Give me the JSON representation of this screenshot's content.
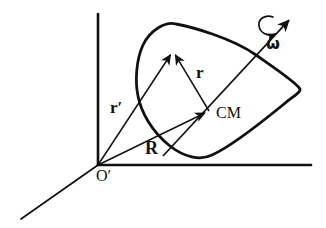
{
  "figure": {
    "type": "physics-vector-diagram",
    "width": 326,
    "height": 228,
    "background_color": "#ffffff",
    "ink_color": "#111111"
  },
  "labels": {
    "r_prime": "r′",
    "r": "r",
    "R": "R",
    "cm": "CM",
    "omega": "ω",
    "origin": "O′"
  },
  "axes": {
    "vertical": {
      "name": "vertical-axis",
      "from": [
        98,
        165
      ],
      "to": [
        98,
        14
      ],
      "stroke_width": 2.6
    },
    "horizontal": {
      "name": "horizontal-axis",
      "from": [
        98,
        165
      ],
      "to": [
        311,
        165
      ],
      "stroke_width": 2.6
    },
    "depth": {
      "name": "depth-axis",
      "from": [
        98,
        165
      ],
      "to": [
        21,
        219
      ],
      "stroke_width": 1.7
    }
  },
  "points": {
    "origin": [
      98,
      165
    ],
    "center_of_mass": [
      209,
      111
    ],
    "particle": [
      173,
      51
    ]
  },
  "vectors": [
    {
      "name": "r-prime-vector",
      "label": "r′",
      "from": [
        98,
        165
      ],
      "to": [
        173,
        51
      ],
      "description": "position of particle from inertial origin O-prime"
    },
    {
      "name": "R-vector",
      "label": "R",
      "from": [
        98,
        165
      ],
      "to": [
        209,
        111
      ],
      "description": "position of center of mass from inertial origin O-prime"
    },
    {
      "name": "r-vector",
      "label": "r",
      "from": [
        209,
        111
      ],
      "to": [
        173,
        51
      ],
      "description": "position of particle relative to center of mass"
    }
  ],
  "rotation_axis": {
    "name": "omega-axis",
    "label": "ω",
    "from": [
      163,
      156
    ],
    "to": [
      291,
      18
    ],
    "arrow_head": true,
    "spin_arrow": {
      "description": "small curved arrow around axis indicating sense of rotation",
      "center": [
        268,
        30
      ]
    }
  },
  "body_outline": {
    "name": "rigid-body-outline",
    "stroke_width": 2.8,
    "closed": true,
    "path": "M 176 24 C 166 21 150 30 143 45 C 136 60 135 82 138 96 C 141 112 152 132 170 146 C 184 157 200 161 212 155 C 230 147 262 122 284 104 C 295 95 301 92 300 89 C 297 83 276 69 256 55 C 232 38 192 27 176 24 Z"
  }
}
